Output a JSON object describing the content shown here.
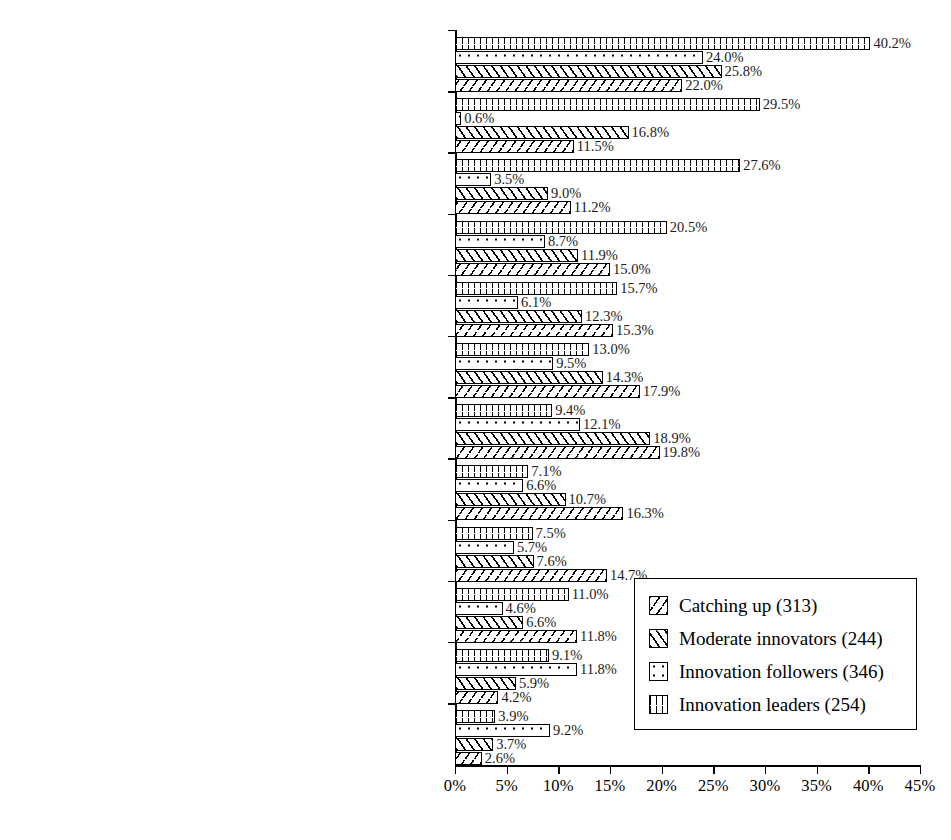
{
  "chart_data": {
    "type": "bar",
    "orientation": "horizontal",
    "title": "",
    "xlabel": "",
    "ylabel": "",
    "xlim": [
      0,
      45
    ],
    "xticks": [
      "0%",
      "5%",
      "10%",
      "15%",
      "20%",
      "25%",
      "30%",
      "35%",
      "40%",
      "45%"
    ],
    "grid": false,
    "legend_position": "bottom-right",
    "series": [
      {
        "name": "Innovation leaders (254)",
        "pattern": "vertical-dash",
        "values": [
          40.2,
          29.5,
          27.6,
          20.5,
          15.7,
          13.0,
          9.4,
          7.1,
          7.5,
          11.0,
          9.1,
          3.9
        ]
      },
      {
        "name": "Innovation followers (346)",
        "pattern": "dots",
        "values": [
          24.0,
          0.6,
          3.5,
          8.7,
          6.1,
          9.5,
          12.1,
          6.6,
          5.7,
          4.6,
          11.8,
          9.2
        ]
      },
      {
        "name": "Moderate innovators (244)",
        "pattern": "forward-hatch",
        "values": [
          25.8,
          16.8,
          9.0,
          11.9,
          12.3,
          14.3,
          18.9,
          10.7,
          7.6,
          6.6,
          5.9,
          3.7
        ]
      },
      {
        "name": "Catching up (313)",
        "pattern": "back-hatch",
        "values": [
          22.0,
          11.5,
          11.2,
          15.0,
          15.3,
          17.9,
          19.8,
          16.3,
          14.7,
          11.8,
          4.2,
          2.6
        ]
      }
    ],
    "categories": [
      {
        "lines": [
          "2.2.3 R&D cooperation",
          "(joint projects, PPP with research institutes)"
        ]
      },
      {
        "lines": [
          "1.2.1 Strategic Research policies",
          "(long-term research agendas)"
        ]
      },
      {
        "lines": [
          "2.1.1 Excellence relevance and",
          "management of research in Universities"
        ]
      },
      {
        "lines": [
          "2.1.2 Public Research Organizations"
        ]
      },
      {
        "lines": [
          "2.2.2 Knowledge Transfer"
        ]
      },
      {
        "lines": [
          "4.3.1 Support to innovative start-ups incl. gazelles"
        ]
      },
      {
        "lines": [
          "2.3.1 Direct support of business R&D (grants and loans)"
        ]
      },
      {
        "lines": [
          "4.2.1 Support to innovation",
          "management and advisory services"
        ]
      },
      {
        "lines": [
          "2.1.4 Research Infrastructures"
        ]
      },
      {
        "lines": [
          "1.3.1 Cluster framework policies"
        ]
      },
      {
        "lines": [
          "4.3.2 Support to risk capital"
        ]
      },
      {
        "lines": [
          "3.2.2 Career development",
          "(e.g. long-term contracts for university researchers)"
        ]
      }
    ],
    "data_labels": [
      [
        "40.2%",
        "24.0%",
        "25.8%",
        "22.0%"
      ],
      [
        "29.5%",
        "0.6%",
        "16.8%",
        "11.5%"
      ],
      [
        "27.6%",
        "3.5%",
        "9.0%",
        "11.2%"
      ],
      [
        "20.5%",
        "8.7%",
        "11.9%",
        "15.0%"
      ],
      [
        "15.7%",
        "6.1%",
        "12.3%",
        "15.3%"
      ],
      [
        "13.0%",
        "9.5%",
        "14.3%",
        "17.9%"
      ],
      [
        "9.4%",
        "12.1%",
        "18.9%",
        "19.8%"
      ],
      [
        "7.1%",
        "6.6%",
        "10.7%",
        "16.3%"
      ],
      [
        "7.5%",
        "5.7%",
        "7.6%",
        "14.7%"
      ],
      [
        "11.0%",
        "4.6%",
        "6.6%",
        "11.8%"
      ],
      [
        "9.1%",
        "11.8%",
        "5.9%",
        "4.2%"
      ],
      [
        "3.9%",
        "9.2%",
        "3.7%",
        "2.6%"
      ]
    ]
  },
  "legend": {
    "items": [
      {
        "label": "Catching up (313)",
        "pattern": "back-hatch"
      },
      {
        "label": "Moderate innovators (244)",
        "pattern": "forward-hatch"
      },
      {
        "label": "Innovation followers (346)",
        "pattern": "dots"
      },
      {
        "label": "Innovation leaders (254)",
        "pattern": "vertical-dash"
      }
    ]
  },
  "colors": {
    "ink": "#000000",
    "background": "#ffffff"
  }
}
